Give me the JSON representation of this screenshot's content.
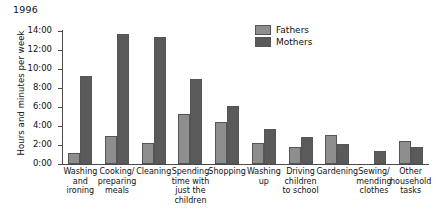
{
  "chart_data": {
    "type": "bar",
    "title": "1996",
    "xlabel": "",
    "ylabel": "Hours and minutes per week",
    "ylim": [
      0,
      14
    ],
    "ytick_labels": [
      "0:00",
      "2:00",
      "4:00",
      "6:00",
      "8:00",
      "10:00",
      "12:00",
      "14:00"
    ],
    "ytick_values": [
      0,
      2,
      4,
      6,
      8,
      10,
      12,
      14
    ],
    "grid": false,
    "legend_position": "top-right",
    "categories": [
      "Washing and ironing",
      "Cooking/ preparing meals",
      "Cleaning",
      "Spending time with just the children",
      "Shopping",
      "Washing up",
      "Driving children to school",
      "Gardening",
      "Sewing/ mending clothes",
      "Other household tasks"
    ],
    "category_label_lines": [
      [
        "Washing",
        "and",
        "ironing"
      ],
      [
        "Cooking/",
        "preparing",
        "meals"
      ],
      [
        "Cleaning"
      ],
      [
        "Spending",
        "time with",
        "just the",
        "children"
      ],
      [
        "Shopping"
      ],
      [
        "Washing",
        "up"
      ],
      [
        "Driving",
        "children",
        "to school"
      ],
      [
        "Gardening"
      ],
      [
        "Sewing/",
        "mending",
        "clothes"
      ],
      [
        "Other",
        "household",
        "tasks"
      ]
    ],
    "series": [
      {
        "name": "Fathers",
        "color": "#8e8e8e",
        "values": [
          1.17,
          3.0,
          2.17,
          5.25,
          4.42,
          2.25,
          1.83,
          3.08,
          0.0,
          2.42
        ],
        "value_labels": [
          "1:10",
          "3:00",
          "2:10",
          "5:15",
          "4:25",
          "2:15",
          "1:50",
          "3:05",
          "0:00",
          "2:25"
        ]
      },
      {
        "name": "Mothers",
        "color": "#5a5a5a",
        "values": [
          9.25,
          13.67,
          13.42,
          8.92,
          6.08,
          3.67,
          2.83,
          2.08,
          1.42,
          1.75
        ],
        "value_labels": [
          "9:15",
          "13:40",
          "13:25",
          "8:55",
          "6:05",
          "3:40",
          "2:50",
          "2:05",
          "1:25",
          "1:45"
        ]
      }
    ]
  },
  "legend": {
    "items": [
      {
        "label": "Fathers",
        "color": "#8e8e8e"
      },
      {
        "label": "Mothers",
        "color": "#5a5a5a"
      }
    ]
  },
  "colors": {
    "fathers": "#8e8e8e",
    "mothers": "#5a5a5a",
    "axis": "#4a4a4a",
    "text": "#111111",
    "background": "#ffffff"
  }
}
